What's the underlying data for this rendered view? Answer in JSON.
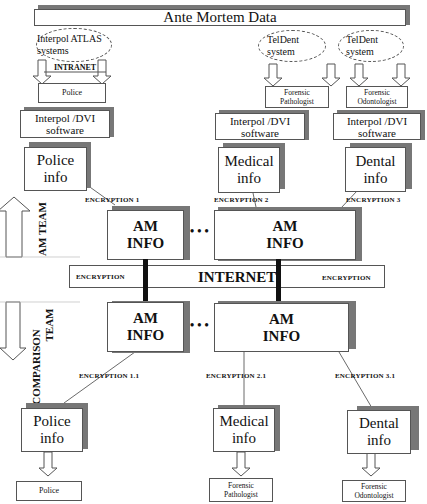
{
  "header": {
    "title": "Ante Mortem Data"
  },
  "sources": [
    {
      "system": "Interpol ATLAS systems",
      "channel": "INTRANET",
      "actor": "Police",
      "software": "Interpol /DVI software",
      "info": "Police info",
      "encryption": "ENCRYPTION 1"
    },
    {
      "system": "TelDent system",
      "channel": "",
      "actor": "Forensic Pathologist",
      "software": "Interpol /DVI software",
      "info": "Medical info",
      "encryption": "ENCRYPTION 2"
    },
    {
      "system": "TelDent system",
      "channel": "",
      "actor": "Forensic Odontologist",
      "software": "Interpol /DVI software",
      "info": "Dental info",
      "encryption": "ENCRYPTION  3"
    }
  ],
  "am_team": {
    "label": "AM TEAM",
    "boxes": [
      {
        "line1": "AM",
        "line2": "INFO"
      },
      {
        "line1": "AM",
        "line2": "INFO"
      }
    ],
    "ellipsis": "• • •"
  },
  "internet_bar": {
    "left": "ENCRYPTION",
    "center": "INTERNET",
    "right": "ENCRYPTION"
  },
  "comparison_team": {
    "label_line1": "COMPARISON",
    "label_line2": "TEAM",
    "boxes": [
      {
        "line1": "AM",
        "line2": "INFO"
      },
      {
        "line1": "AM",
        "line2": "INFO"
      }
    ],
    "ellipsis": "• • •"
  },
  "outputs": [
    {
      "encryption": "ENCRYPTION 1.1",
      "info": "Police info",
      "actor": "Police"
    },
    {
      "encryption": "ENCRYPTION 2.1",
      "info": "Medical info",
      "actor": "Forensic Pathologist"
    },
    {
      "encryption": "ENCRYPTION 3.1",
      "info": "Dental info",
      "actor": "Forensic Odontologist"
    }
  ],
  "colors": {
    "shadow": "#777777",
    "border": "#555555",
    "connector": "#111111"
  }
}
